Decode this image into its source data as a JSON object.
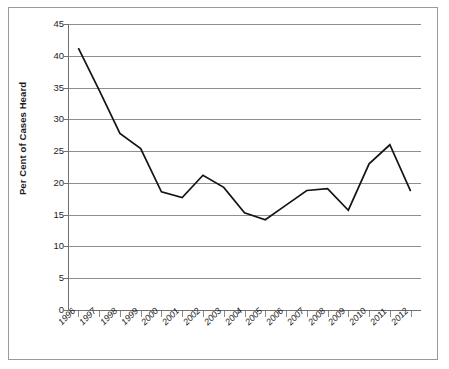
{
  "chart_data": {
    "type": "line",
    "title": "",
    "subtitle": "",
    "xlabel": "",
    "ylabel": "Per Cent of Cases Heard",
    "categories": [
      "1996",
      "1997",
      "1998",
      "1999",
      "2000",
      "2001",
      "2002",
      "2003",
      "2004",
      "2005",
      "2006",
      "2007",
      "2008",
      "2009",
      "2010",
      "2011",
      "2012"
    ],
    "series": [
      {
        "name": "Per Cent of Cases Heard",
        "color": "#141414",
        "values": [
          41.2,
          34.6,
          27.8,
          25.4,
          18.6,
          17.7,
          21.2,
          19.3,
          15.3,
          14.2,
          16.5,
          18.8,
          19.1,
          15.7,
          23.0,
          26.0,
          18.7
        ]
      }
    ],
    "ylim": [
      0,
      45
    ],
    "y_ticks": [
      0,
      5,
      10,
      15,
      20,
      25,
      30,
      35,
      40,
      45
    ],
    "y_tick_labels": [
      "0",
      "5",
      "10",
      "15",
      "20",
      "25",
      "30",
      "35",
      "40",
      "45"
    ],
    "x_tick_labels": [
      "1996",
      "1997",
      "1998",
      "1999",
      "2000",
      "2001",
      "2002",
      "2003",
      "2004",
      "2005",
      "2006",
      "2007",
      "2008",
      "2009",
      "2010",
      "2011",
      "2012"
    ],
    "grid": true,
    "grid_axis": "y",
    "grid_color": "#8e8e8e",
    "legend": false,
    "legend_position": "none",
    "annotations": [],
    "axis_color": "#6f6f6f",
    "background": "#ffffff",
    "frame": true
  }
}
